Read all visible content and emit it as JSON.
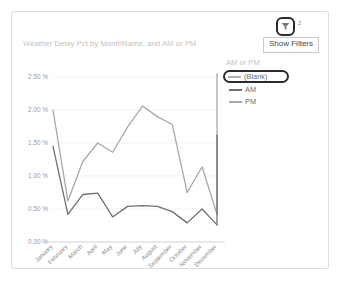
{
  "card": {
    "title": "Weather Delay Pct by MonthName, and AM or PM"
  },
  "toolbar": {
    "filter_icon": "funnel-icon",
    "filter_badge": "2",
    "tooltip_label": "Show Filters"
  },
  "legend": {
    "title": "AM or PM",
    "items": [
      {
        "label": "(Blank)",
        "color": "#b0b0b0",
        "highlighted": true
      },
      {
        "label": "AM",
        "color": "#6f6f6f",
        "highlighted": false
      },
      {
        "label": "PM",
        "color": "#a8a8a8",
        "highlighted": false
      }
    ]
  },
  "chart_data": {
    "type": "line",
    "title": "Weather Delay Pct by MonthName, and AM or PM",
    "xlabel": "MonthName",
    "ylabel": "Weather Delay Pct",
    "categories": [
      "January",
      "February",
      "March",
      "April",
      "May",
      "June",
      "July",
      "August",
      "September",
      "October",
      "November",
      "December"
    ],
    "ytick_labels": [
      "0.00 %",
      "0.50 %",
      "1.00 %",
      "1.50 %",
      "2.00 %",
      "2.50 %"
    ],
    "ytick_values": [
      0.0,
      0.5,
      1.0,
      1.5,
      2.0,
      2.5
    ],
    "ylim": [
      0.0,
      2.5
    ],
    "grid": true,
    "legend_position": "right",
    "series": [
      {
        "name": "PM",
        "color": "#a8a8a8",
        "values": [
          2.0,
          0.62,
          1.22,
          1.5,
          1.36,
          1.74,
          2.06,
          1.9,
          1.78,
          0.75,
          1.14,
          0.42
        ]
      },
      {
        "name": "AM",
        "color": "#6f6f6f",
        "values": [
          1.45,
          0.42,
          0.72,
          0.74,
          0.38,
          0.54,
          0.55,
          0.54,
          0.46,
          0.29,
          0.5,
          0.26
        ]
      },
      {
        "name": "PM-december-spike",
        "color": "#a8a8a8",
        "hidden": true,
        "values": [
          null,
          null,
          null,
          null,
          null,
          null,
          null,
          null,
          null,
          null,
          null,
          2.55
        ]
      },
      {
        "name": "AM-december-spike",
        "color": "#6f6f6f",
        "hidden": true,
        "values": [
          null,
          null,
          null,
          null,
          null,
          null,
          null,
          null,
          null,
          null,
          null,
          1.62
        ]
      }
    ]
  }
}
